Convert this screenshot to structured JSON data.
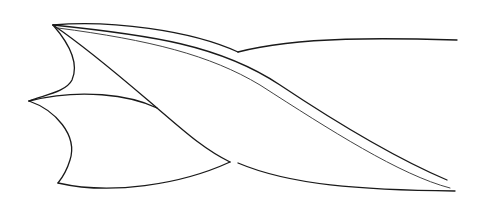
{
  "diagram": {
    "colors": {
      "background": "#ffffff",
      "line": "#1a1a1a",
      "secondary_line": "#444444"
    },
    "parts": [
      {
        "name": "upper-lip-tip"
      },
      {
        "name": "middle-point"
      },
      {
        "name": "lower-lip-tip"
      },
      {
        "name": "flute-edge-outer"
      },
      {
        "name": "flute-edge-inner"
      },
      {
        "name": "cutting-edge"
      },
      {
        "name": "body-top-edge"
      },
      {
        "name": "body-bottom-edge"
      }
    ]
  }
}
